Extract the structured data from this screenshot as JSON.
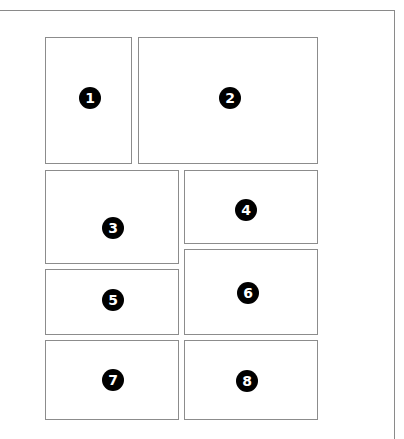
{
  "diagram": {
    "colors": {
      "border": "#8c8c8c",
      "badge_bg": "#000000",
      "badge_text": "#ffffff",
      "background": "#ffffff"
    },
    "panels": [
      {
        "number": "1",
        "label": "1"
      },
      {
        "number": "2",
        "label": "2"
      },
      {
        "number": "3",
        "label": "3"
      },
      {
        "number": "4",
        "label": "4"
      },
      {
        "number": "5",
        "label": "5"
      },
      {
        "number": "6",
        "label": "6"
      },
      {
        "number": "7",
        "label": "7"
      },
      {
        "number": "8",
        "label": "8"
      }
    ]
  }
}
